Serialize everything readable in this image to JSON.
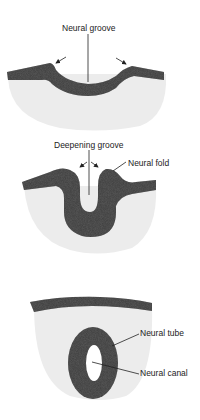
{
  "diagram": {
    "colors": {
      "neural_tissue": "#3a3a3a",
      "mesoderm": "#ececec",
      "background": "#ffffff",
      "line": "#222222"
    },
    "stages": [
      {
        "id": "stage1",
        "labels": [
          {
            "text": "Neural groove"
          }
        ]
      },
      {
        "id": "stage2",
        "labels": [
          {
            "text": "Deepening groove"
          },
          {
            "text": "Neural fold"
          }
        ]
      },
      {
        "id": "stage3",
        "labels": [
          {
            "text": "Neural tube"
          },
          {
            "text": "Neural canal"
          }
        ]
      }
    ]
  }
}
